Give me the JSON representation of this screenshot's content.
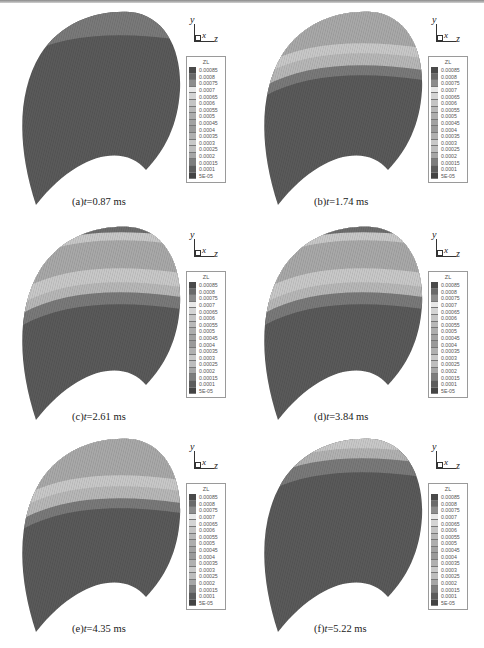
{
  "figure": {
    "legend": {
      "title": "ZL",
      "levels": [
        "0.00085",
        "0.0008",
        "0.00075",
        "0.0007",
        "0.00065",
        "0.0006",
        "0.00055",
        "0.0005",
        "0.00045",
        "0.0004",
        "0.00035",
        "0.0003",
        "0.00025",
        "0.0002",
        "0.00015",
        "0.0001",
        "5E-05"
      ],
      "colors": [
        "#4a4a4a",
        "#6a6a6a",
        "#8c8c8c",
        "#e8e8e8",
        "#d4d4d4",
        "#c4c4c4",
        "#b8b8b8",
        "#adadad",
        "#a2a2a2",
        "#9a9a9a",
        "#b0b0b0",
        "#c8c8c8",
        "#bdbdbd",
        "#a6a6a6",
        "#7d7d7d",
        "#5c5c5c",
        "#444444"
      ]
    },
    "axes": {
      "y": "y",
      "x": "x",
      "z": "z"
    },
    "colors": {
      "base": "#5a5a5a",
      "band1": "#7a7a7a",
      "band2": "#b8b8b8",
      "band3": "#c9c9c9",
      "band4": "#a9a9a9",
      "peak": "#6e6e6e"
    },
    "panels": [
      {
        "id": "a",
        "label_prefix": "(a)",
        "var": "t",
        "value": "=0.87 ms"
      },
      {
        "id": "b",
        "label_prefix": "(b)",
        "var": "t",
        "value": "=1.74 ms"
      },
      {
        "id": "c",
        "label_prefix": "(c)",
        "var": "t",
        "value": "=2.61 ms"
      },
      {
        "id": "d",
        "label_prefix": "(d)",
        "var": "t",
        "value": "=3.84 ms"
      },
      {
        "id": "e",
        "label_prefix": "(e)",
        "var": "t",
        "value": "=4.35 ms"
      },
      {
        "id": "f",
        "label_prefix": "(f)",
        "var": "t",
        "value": "=5.22 ms"
      }
    ]
  }
}
